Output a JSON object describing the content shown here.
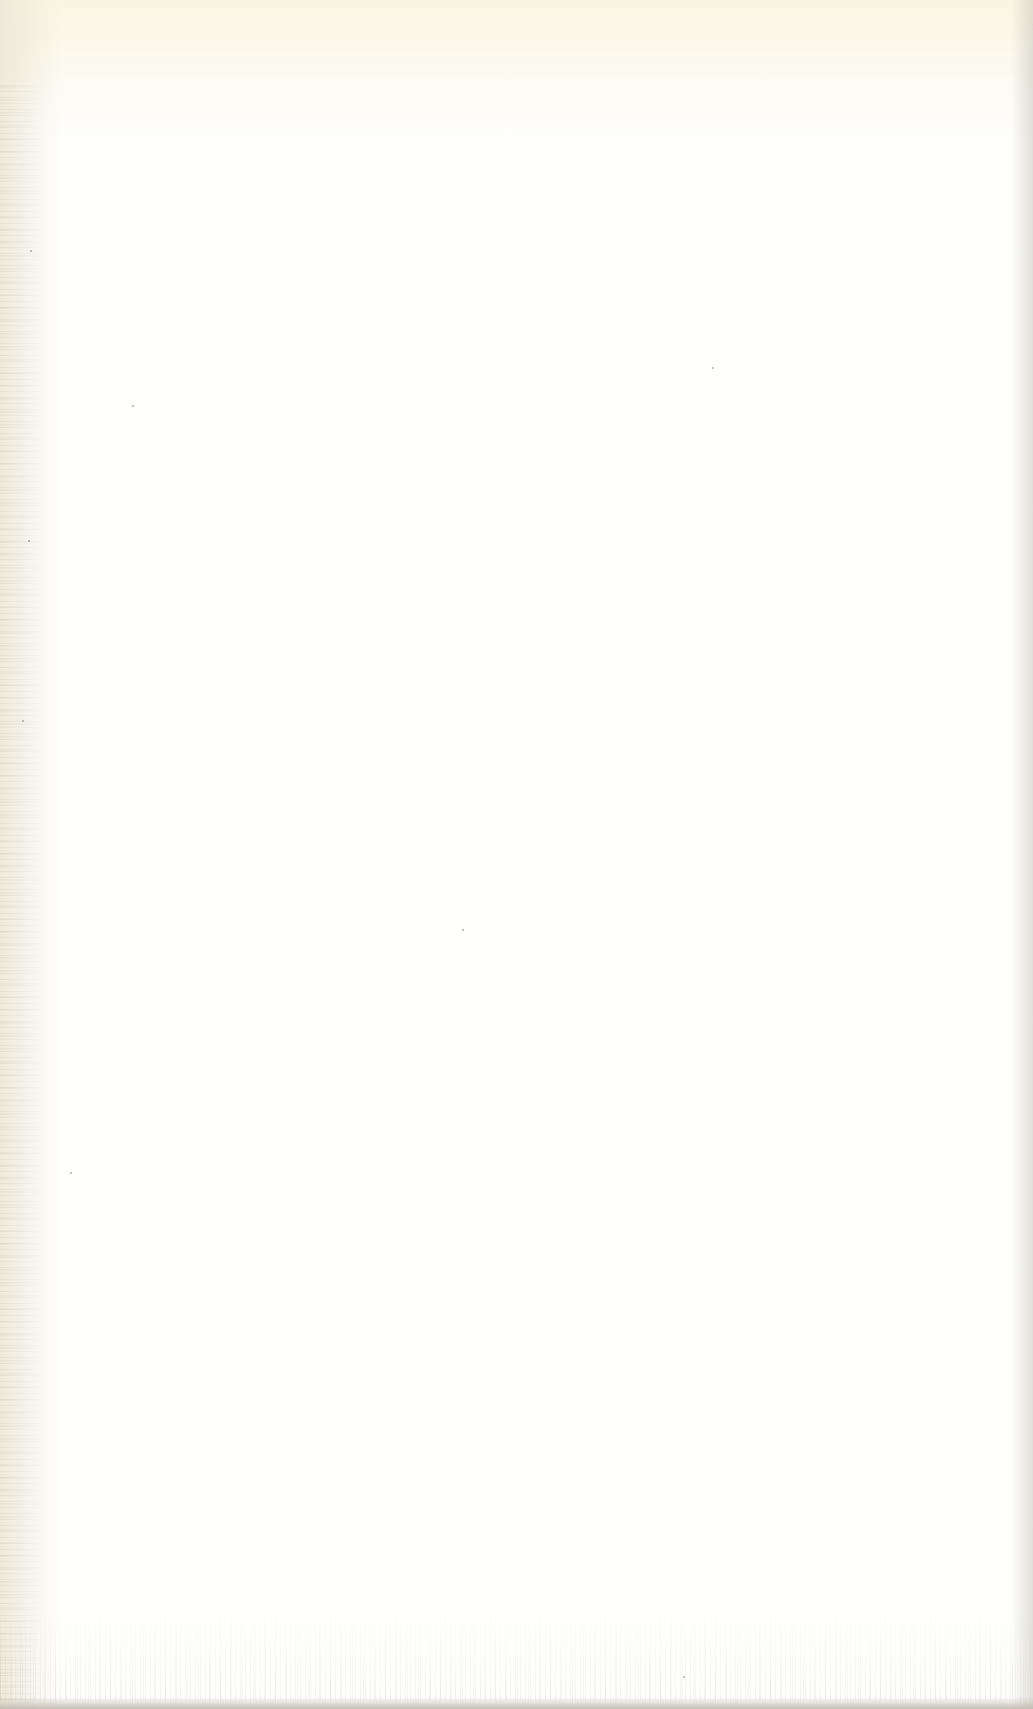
{
  "page": {
    "content": "",
    "is_blank": true
  },
  "colors": {
    "paper": "#fefefd",
    "top_tint": "#faf4de",
    "edge_shadow": "#c8c6bc"
  }
}
